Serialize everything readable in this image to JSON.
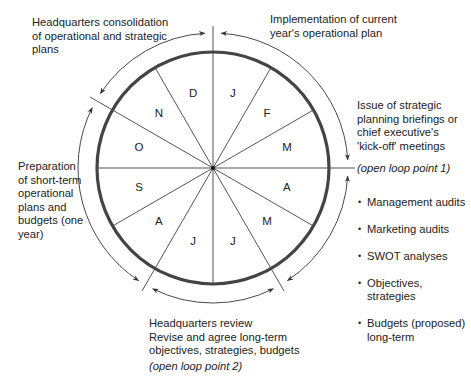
{
  "diagram": {
    "center": {
      "x": 213,
      "y": 168
    },
    "circle_radius": 116,
    "outer_arc_radius": 135,
    "tick_radius": 142,
    "line_color": "#555555",
    "circle_color": "#444444",
    "months": [
      {
        "label": "J",
        "angle_deg": -75
      },
      {
        "label": "F",
        "angle_deg": -45
      },
      {
        "label": "M",
        "angle_deg": -15
      },
      {
        "label": "A",
        "angle_deg": 15
      },
      {
        "label": "M",
        "angle_deg": 45
      },
      {
        "label": "J",
        "angle_deg": 75
      },
      {
        "label": "J",
        "angle_deg": 105
      },
      {
        "label": "A",
        "angle_deg": 135
      },
      {
        "label": "S",
        "angle_deg": 165
      },
      {
        "label": "O",
        "angle_deg": 195
      },
      {
        "label": "N",
        "angle_deg": 225
      },
      {
        "label": "D",
        "angle_deg": 255
      }
    ],
    "tick_angles_deg": [
      -90,
      0,
      60,
      120,
      210
    ]
  },
  "labels": {
    "hq_consolidation": "Headquarters consolidation\nof operational and strategic\nplans",
    "implementation": "Implementation of current\nyear's operational plan",
    "issue_briefings": "Issue of strategic\nplanning briefings or\nchief executive's\n'kick-off' meetings",
    "open_loop_1": "(open loop point 1)",
    "bullets": [
      "Management audits",
      "Marketing audits",
      "SWOT analyses",
      "Objectives,\nstrategies",
      "Budgets (proposed)\nlong-term"
    ],
    "preparation": "Preparation\nof short-term\noperational\nplans and\nbudgets (one\nyear)",
    "hq_review": "Headquarters review\nRevise and agree long-term\nobjectives, strategies, budgets",
    "open_loop_2": "(open loop point 2)"
  }
}
